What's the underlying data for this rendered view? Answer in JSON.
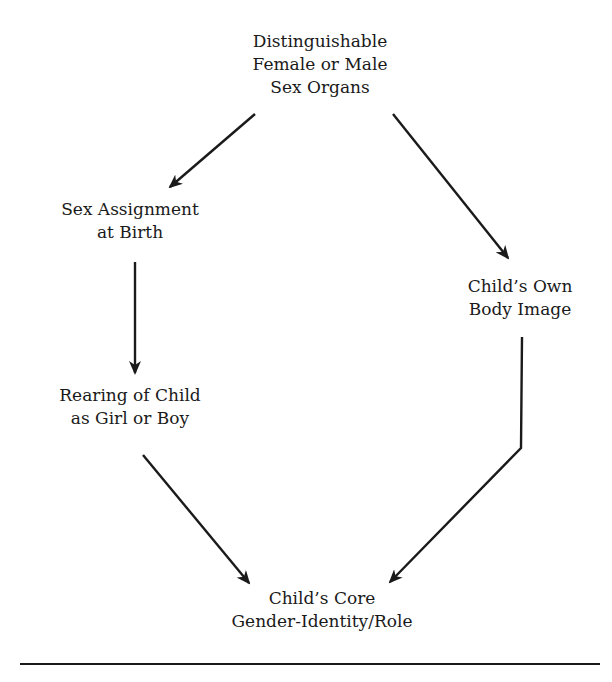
{
  "diagram": {
    "nodes": {
      "sex_organs": {
        "lines": [
          "Distinguishable",
          "Female or Male",
          "Sex Organs"
        ]
      },
      "sex_assignment": {
        "lines": [
          "Sex Assignment",
          "at Birth"
        ]
      },
      "body_image": {
        "lines": [
          "Child’s Own",
          "Body Image"
        ]
      },
      "rearing": {
        "lines": [
          "Rearing of Child",
          "as Girl or Boy"
        ]
      },
      "core_identity": {
        "lines": [
          "Child’s Core",
          "Gender-Identity/Role"
        ]
      }
    },
    "edges": [
      {
        "from": "Distinguishable Female or Male Sex Organs",
        "to": "Sex Assignment at Birth"
      },
      {
        "from": "Distinguishable Female or Male Sex Organs",
        "to": "Child’s Own Body Image"
      },
      {
        "from": "Sex Assignment at Birth",
        "to": "Rearing of Child as Girl or Boy"
      },
      {
        "from": "Rearing of Child as Girl or Boy",
        "to": "Child’s Core Gender-Identity/Role"
      },
      {
        "from": "Child’s Own Body Image",
        "to": "Child’s Core Gender-Identity/Role"
      }
    ],
    "colors": {
      "ink": "#1a1a1a",
      "background": "#ffffff"
    }
  }
}
